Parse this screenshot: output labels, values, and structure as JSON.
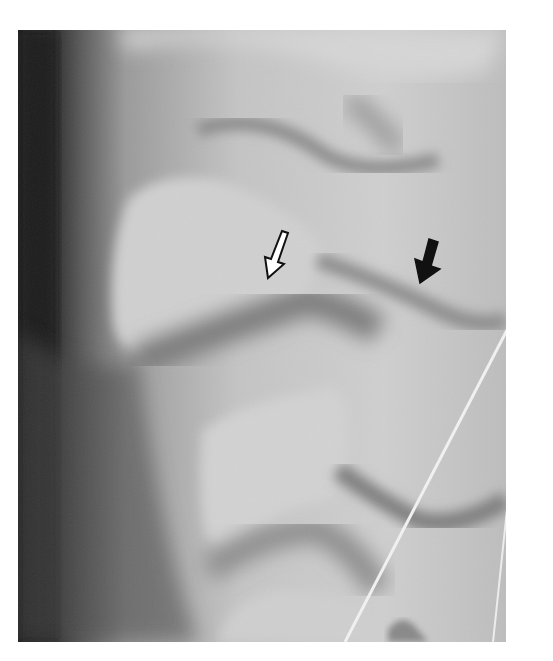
{
  "figure": {
    "type": "radiograph",
    "background_color": "#ffffff",
    "frame": {
      "x": 18,
      "y": 30,
      "width": 488,
      "height": 612
    },
    "annotations": [
      {
        "name": "open-arrow",
        "style": "outlined",
        "color": "#111111",
        "fill": "#ffffff",
        "pointing": "down-left",
        "tip": [
          268,
          278
        ]
      },
      {
        "name": "solid-arrow",
        "style": "filled",
        "color": "#111111",
        "pointing": "down-left",
        "tip": [
          420,
          282
        ]
      }
    ],
    "overlays": [
      {
        "name": "wire-line",
        "color": "#f2f2f2",
        "from": [
          533,
          280
        ],
        "to": [
          345,
          642
        ]
      },
      {
        "name": "wire-line-right",
        "color": "#f2f2f2",
        "from": [
          506,
          520
        ],
        "to": [
          495,
          642
        ]
      }
    ]
  }
}
